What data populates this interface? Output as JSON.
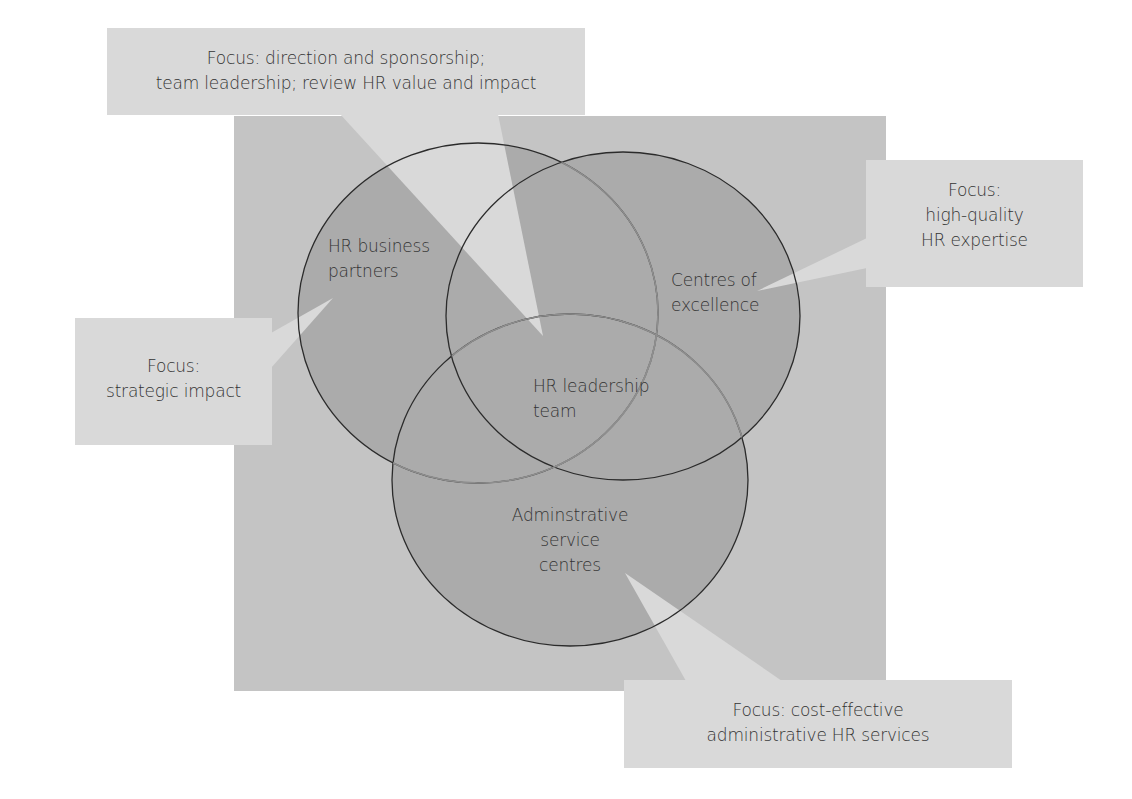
{
  "colors": {
    "background": "#ffffff",
    "panel": "#c4c4c4",
    "circle_fill": "#ababab",
    "callout_fill": "#d9d9d9",
    "stroke_dark": "#2b2b2b",
    "stroke_light": "#8e8e8e",
    "text": "#333333"
  },
  "circles": [
    {
      "id": "hr-business-partners",
      "label": "HR business\npartners"
    },
    {
      "id": "centres-of-excellence",
      "label": "Centres of\nexcellence"
    },
    {
      "id": "hr-leadership-team",
      "label": "HR leadership\nteam"
    },
    {
      "id": "administrative-service-centres",
      "label": "Adminstrative\nservice\ncentres"
    }
  ],
  "callouts": {
    "top": "Focus: direction and sponsorship;\nteam leadership; review HR value and impact",
    "right": "Focus:\nhigh-quality\nHR expertise",
    "left": "Focus:\nstrategic impact",
    "bottom": "Focus: cost-effective\nadministrative HR services"
  }
}
